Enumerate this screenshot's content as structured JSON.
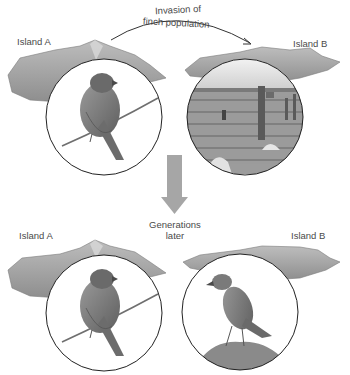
{
  "diagram": {
    "type": "allopatric-speciation-illustration",
    "arrow_label_line1": "Invasion of",
    "arrow_label_line2": "finch population",
    "transition_label_line1": "Generations",
    "transition_label_line2": "later",
    "top_row": {
      "left": {
        "island_label": "Island A",
        "inset": "finch perched on branch"
      },
      "right": {
        "island_label": "Island B",
        "inset": "arid landscape with cacti"
      }
    },
    "bottom_row": {
      "left": {
        "island_label": "Island A",
        "inset": "finch perched on branch"
      },
      "right": {
        "island_label": "Island B",
        "inset": "slender finch standing on rock"
      }
    },
    "colors": {
      "island": "#a9a9a9",
      "island_dark": "#7d7d7d",
      "down_arrow": "#a6a6a6",
      "circle_stroke": "#222222",
      "text": "#4a4a4a"
    }
  }
}
